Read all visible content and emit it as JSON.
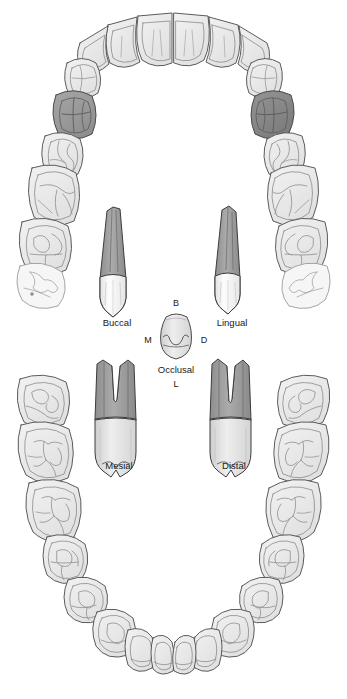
{
  "figure": {
    "background_color": "#ffffff",
    "width": 347,
    "height": 699
  },
  "palette": {
    "outline": "#3a3a3a",
    "outline_light": "#6e6e6e",
    "tooth_fill": "#e8e8e8",
    "tooth_fill_light": "#f1f1f1",
    "tooth_fill_lighter": "#f7f7f7",
    "highlight_left": "#9a9a9a",
    "highlight_right": "#868686",
    "root_fill": "#9e9e9e",
    "root_fill_dark": "#8f8f8f",
    "crown_fill": "#fbfbfb",
    "crown_fill_gray": "#dcdcdc",
    "label_color": "#1a1a1a"
  },
  "views": {
    "buccal": {
      "label": "Buccal",
      "x": 117,
      "y": 323
    },
    "lingual": {
      "label": "Lingual",
      "x": 232,
      "y": 323
    },
    "occlusal": {
      "label": "Occlusal",
      "x": 176,
      "y": 370
    },
    "mesial": {
      "label": "Mesial",
      "x": 119,
      "y": 466
    },
    "distal": {
      "label": "Distal",
      "x": 234,
      "y": 466
    }
  },
  "orientation_labels": {
    "buccal_abbrev": {
      "label": "B",
      "x": 176,
      "y": 304
    },
    "mesial_abbrev": {
      "label": "M",
      "x": 148,
      "y": 341
    },
    "distal_abbrev": {
      "label": "D",
      "x": 204,
      "y": 341
    },
    "lingual_abbrev": {
      "label": "L",
      "x": 176,
      "y": 385
    }
  },
  "arches": {
    "upper": {
      "name": "maxillary-arch",
      "highlighted_teeth": [
        "upper-left-first-molar",
        "upper-right-first-molar"
      ]
    },
    "lower": {
      "name": "mandibular-arch",
      "highlighted_teeth": []
    }
  }
}
